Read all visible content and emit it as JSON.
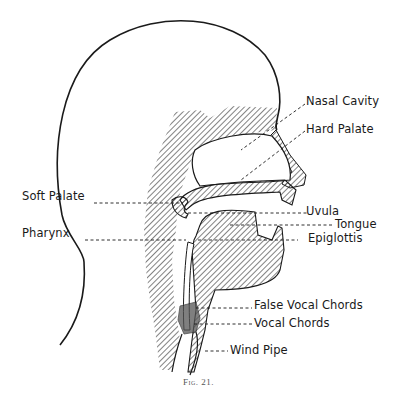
{
  "figure": {
    "caption": "Fig. 21.",
    "colors": {
      "ink": "#1a1a1a",
      "background": "#ffffff",
      "caption": "#555555"
    }
  },
  "labels": {
    "nasal_cavity": "Nasal Cavity",
    "hard_palate": "Hard Palate",
    "soft_palate": "Soft Palate",
    "pharynx": "Pharynx",
    "uvula": "Uvula",
    "tongue": "Tongue",
    "epiglottis": "Epiglottis",
    "false_vocal_chords": "False Vocal Chords",
    "vocal_chords": "Vocal Chords",
    "wind_pipe": "Wind Pipe"
  }
}
